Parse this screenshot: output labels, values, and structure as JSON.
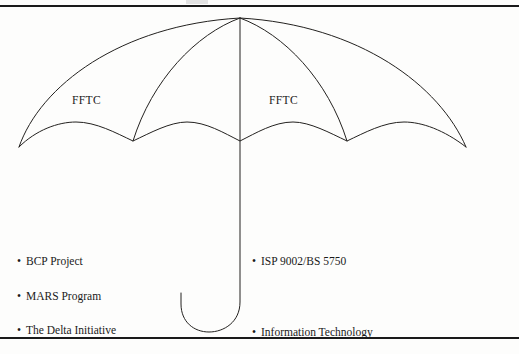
{
  "page": {
    "background_color": "#fdfdfc",
    "ink_color": "#23211f",
    "rule_color": "#1a1a1a"
  },
  "diagram": {
    "type": "umbrella-diagram",
    "name": "umbrella",
    "canopy_labels": [
      {
        "text": "FFTC",
        "position": "canopy-left"
      },
      {
        "text": "FFTC",
        "position": "canopy-right"
      }
    ],
    "bullet_glyph": "•",
    "left_list": [
      {
        "text": "BCP Project"
      },
      {
        "text": "MARS Program"
      },
      {
        "text": "The Delta Initiative"
      }
    ],
    "right_list": [
      {
        "text": "ISP 9002/BS 5750"
      },
      {
        "text": "Information Technology"
      }
    ]
  }
}
